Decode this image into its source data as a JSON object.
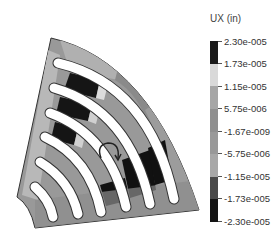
{
  "legend": {
    "title": "UX (in)",
    "ticks": [
      "2.30e-005",
      "1.73e-005",
      "1.15e-005",
      "5.75e-006",
      "-1.67e-009",
      "-5.75e-006",
      "-1.15e-005",
      "-1.73e-005",
      "-2.30e-005"
    ],
    "segments": [
      {
        "color": "#1a1a1a"
      },
      {
        "color": "#d9d9d9"
      },
      {
        "color": "#a6a6a6"
      },
      {
        "color": "#8f8f8f"
      },
      {
        "color": "#999999"
      },
      {
        "color": "#a8a8a8"
      },
      {
        "color": "#4a4a4a"
      },
      {
        "color": "#141414"
      }
    ]
  },
  "figure": {
    "annotation": "rotation-arrow"
  }
}
